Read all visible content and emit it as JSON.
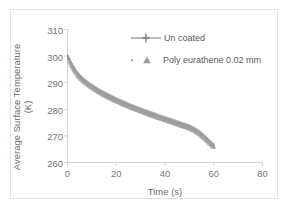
{
  "chart_data": {
    "type": "line",
    "title": "",
    "xlabel": "Time (s)",
    "ylabel_line1": "Average Surface Temperature",
    "ylabel_line2": "(K)",
    "xlim": [
      0,
      80
    ],
    "ylim": [
      260,
      310
    ],
    "xticks": [
      "0",
      "20",
      "40",
      "60",
      "80"
    ],
    "xtick_values": [
      0,
      20,
      40,
      60,
      80
    ],
    "yticks": [
      "260",
      "270",
      "280",
      "290",
      "300",
      "310"
    ],
    "ytick_values": [
      260,
      270,
      280,
      290,
      300,
      310
    ],
    "grid": false,
    "legend_position": "top-right-inside",
    "series": [
      {
        "name": "Un coated",
        "marker": "line-with-cross-marker",
        "color": "#8c8c8c",
        "x": [
          0,
          0.5,
          1,
          1.5,
          2,
          3,
          4,
          5,
          6,
          7,
          8,
          9,
          10,
          12,
          14,
          16,
          18,
          20,
          22,
          24,
          26,
          28,
          30,
          32,
          34,
          36,
          38,
          40,
          42,
          44,
          46,
          48,
          50,
          52,
          54,
          56,
          58,
          60
        ],
        "y": [
          300.0,
          299.2,
          298.2,
          297.2,
          296.3,
          294.8,
          293.5,
          292.4,
          291.5,
          290.7,
          290.0,
          289.3,
          288.7,
          287.5,
          286.4,
          285.4,
          284.5,
          283.6,
          282.8,
          282.0,
          281.2,
          280.5,
          279.8,
          279.1,
          278.4,
          277.8,
          277.1,
          276.5,
          275.9,
          275.3,
          274.6,
          274.0,
          273.4,
          272.5,
          271.3,
          269.8,
          268.0,
          266.3
        ]
      },
      {
        "name": "Poly eurathene 0.02 mm",
        "marker": "triangle",
        "color": "#a0a0a0",
        "x": [
          0,
          0.5,
          1,
          1.5,
          2,
          3,
          4,
          5,
          6,
          7,
          8,
          9,
          10,
          12,
          14,
          16,
          18,
          20,
          22,
          24,
          26,
          28,
          30,
          32,
          34,
          36,
          38,
          40,
          42,
          44,
          46,
          48,
          50,
          52,
          54,
          56,
          58,
          60
        ],
        "y": [
          299.6,
          298.8,
          297.8,
          296.8,
          295.9,
          294.4,
          293.1,
          292.0,
          291.1,
          290.3,
          289.6,
          288.9,
          288.3,
          287.1,
          286.0,
          285.0,
          284.1,
          283.2,
          282.4,
          281.6,
          280.8,
          280.1,
          279.4,
          278.7,
          278.0,
          277.4,
          276.7,
          276.1,
          275.5,
          274.9,
          274.2,
          273.6,
          273.0,
          272.1,
          270.9,
          269.4,
          267.6,
          265.9
        ]
      }
    ],
    "legend": [
      {
        "label": "Un coated",
        "marker": "line-with-cross-marker",
        "color": "#8c8c8c"
      },
      {
        "label": "Poly eurathene 0.02 mm",
        "marker": "triangle-with-dot",
        "color": "#a0a0a0"
      }
    ],
    "colors": {
      "axis": "#d0d0d0",
      "tick_text": "#767676",
      "title_text": "#6d6d6d",
      "series_gray": "#8c8c8c",
      "frame": "#e2e2e2",
      "background": "#ffffff"
    }
  }
}
